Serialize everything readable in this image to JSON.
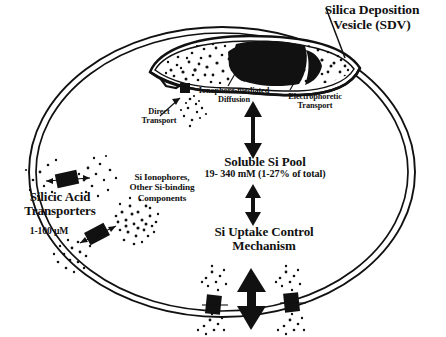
{
  "figure": {
    "kind": "cell-schematic",
    "background_color": "#ffffff",
    "ink_color": "#000000"
  },
  "labels": {
    "sdv": "Silica Deposition\nVesicle (SDV)",
    "ionophore_diffusion": "Ionophore-mediated\nDiffusion",
    "electrophoretic_transport": "Electrophoretic\nTransport",
    "direct_transport": "Direct\nTransport",
    "soluble_pool_title": "Soluble Si Pool",
    "soluble_pool_value": "19- 340 mM (1-27% of total)",
    "si_ionophores": "Si Ionophores,\nOther Si-binding\nComponents",
    "silicic_acid_transporters": "Silicic Acid\nTransporters",
    "transporter_concentration": "1-100 µM",
    "uptake_control": "Si Uptake Control\nMechanism"
  },
  "structures": {
    "cell_wall": "double-line-ellipse",
    "sdv_shape": "crescent-lens-vesicle",
    "sdv_contents": "stippled-silica-with-dense-black-core",
    "membrane_transporters": "black-rectangular-channel-blocks",
    "stipple_clouds": "silicic-acid-particles"
  },
  "arrows": {
    "sdv_to_pool": "double-headed-vertical",
    "pool_to_uptake": "double-headed-vertical",
    "membrane_exchange": "double-headed-vertical-bold",
    "direct_transport_leader": "thin-pointer",
    "transporter_flux": "small-double-headed"
  }
}
